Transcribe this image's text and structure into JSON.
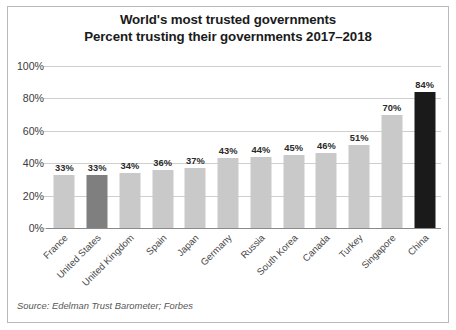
{
  "chart_data": {
    "type": "bar",
    "title": "World's most trusted governments",
    "title_lines": [
      "World's most trusted governments",
      "Percent trusting their governments 2017–2018"
    ],
    "subtitle": "Percent trusting their governments 2017–2018",
    "xlabel": "",
    "ylabel": "",
    "ylim": [
      0,
      100
    ],
    "ytick_labels": [
      "0%",
      "20%",
      "40%",
      "60%",
      "80%",
      "100%"
    ],
    "ytick_values": [
      0,
      20,
      40,
      60,
      80,
      100
    ],
    "grid": true,
    "legend": "none",
    "categories": [
      "France",
      "United States",
      "United Kingdom",
      "Spain",
      "Japan",
      "Germany",
      "Russia",
      "South Korea",
      "Canada",
      "Turkey",
      "Singapore",
      "China"
    ],
    "values": [
      33,
      33,
      34,
      36,
      37,
      43,
      44,
      45,
      46,
      51,
      70,
      84
    ],
    "value_labels": [
      "33%",
      "33%",
      "34%",
      "36%",
      "37%",
      "43%",
      "44%",
      "45%",
      "46%",
      "51%",
      "70%",
      "84%"
    ],
    "bar_colors": [
      "#c9c9c9",
      "#7f7f7f",
      "#c9c9c9",
      "#c9c9c9",
      "#c9c9c9",
      "#c9c9c9",
      "#c9c9c9",
      "#c9c9c9",
      "#c9c9c9",
      "#c9c9c9",
      "#c9c9c9",
      "#1a1a1a"
    ],
    "highlighted": [
      "United States",
      "China"
    ],
    "source": "Source: Edelman Trust Barometer; Forbes"
  },
  "colors": {
    "bar_default": "#c9c9c9",
    "bar_highlight_gray": "#7f7f7f",
    "bar_highlight_black": "#1a1a1a",
    "gridline": "#cfcfcf",
    "axis": "#8a8a8a",
    "frame": "#b9b9b9",
    "background": "#ffffff",
    "title_text": "#1b1b1b",
    "tick_text": "#3c3c3c",
    "source_text": "#575757"
  },
  "footer": {
    "source": "Source: Edelman Trust Barometer; Forbes"
  }
}
